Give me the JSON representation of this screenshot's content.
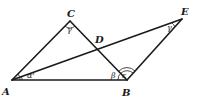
{
  "diagram": {
    "points": {
      "A": {
        "label": "A",
        "x": 12,
        "y": 80
      },
      "B": {
        "label": "B",
        "x": 127,
        "y": 80
      },
      "C": {
        "label": "C",
        "x": 70,
        "y": 21
      },
      "D": {
        "label": "D",
        "x": 97,
        "y": 46
      },
      "E": {
        "label": "E",
        "x": 182,
        "y": 19
      }
    },
    "segments": [
      "AB",
      "AC",
      "CB",
      "AE",
      "BE"
    ],
    "angles": {
      "A": {
        "label": "α'"
      },
      "C": {
        "label": "γ"
      },
      "B_left": {
        "label": "β"
      },
      "B_right": {
        "label": "ε"
      },
      "E": {
        "label": "γ"
      }
    },
    "colors": {
      "ink": "#1a1a1a",
      "background": "#ffffff"
    }
  }
}
